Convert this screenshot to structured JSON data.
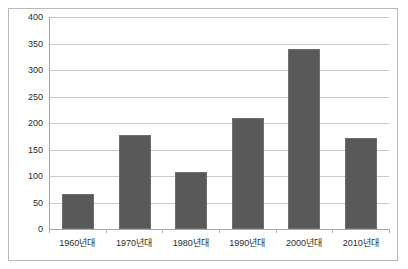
{
  "chart_data": {
    "type": "bar",
    "title": "",
    "subtitle": "",
    "xlabel": "",
    "ylabel": "",
    "categories": [
      "1960년대",
      "1970년대",
      "1980년대",
      "1990년대",
      "2000년대",
      "2010년대"
    ],
    "values": [
      67,
      177,
      107,
      210,
      340,
      171
    ],
    "series": [
      {
        "name": "",
        "values": [
          67,
          177,
          107,
          210,
          340,
          171
        ]
      }
    ],
    "ylim": [
      0,
      400
    ],
    "ytick_labels": [
      "400",
      "350",
      "300",
      "250",
      "200",
      "150",
      "100",
      "50",
      "0"
    ],
    "ytick_values": [
      400,
      350,
      300,
      250,
      200,
      150,
      100,
      50,
      0
    ],
    "grid": true,
    "legend": false,
    "legend_position": "none",
    "bar_color": "#595959",
    "gridline_color": "#c8c8c8",
    "axis_color": "#a6a6a6",
    "frame_color": "#b9b9b9",
    "background": "#ffffff"
  }
}
